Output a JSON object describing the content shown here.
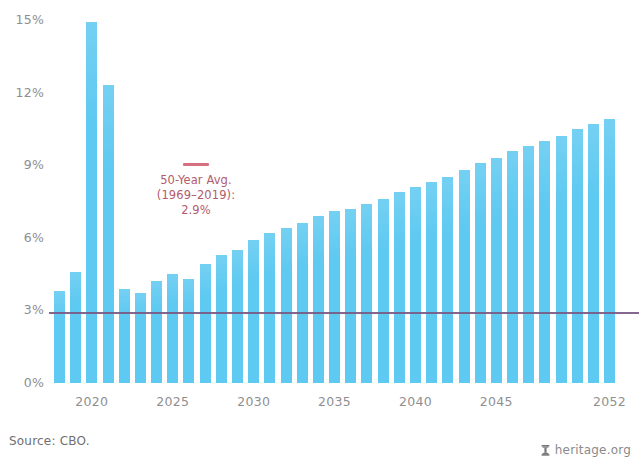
{
  "chart_data": {
    "type": "bar",
    "title": "",
    "subtitle": "",
    "xlabel": "",
    "ylabel": "",
    "categories": [
      "2018",
      "2019",
      "2020",
      "2021",
      "2022",
      "2023",
      "2024",
      "2025",
      "2026",
      "2027",
      "2028",
      "2029",
      "2030",
      "2031",
      "2032",
      "2033",
      "2034",
      "2035",
      "2036",
      "2037",
      "2038",
      "2039",
      "2040",
      "2041",
      "2042",
      "2043",
      "2044",
      "2045",
      "2046",
      "2047",
      "2048",
      "2049",
      "2050",
      "2051",
      "2052"
    ],
    "values": [
      3.8,
      4.6,
      14.9,
      12.3,
      3.9,
      3.7,
      4.2,
      4.5,
      4.3,
      4.9,
      5.3,
      5.5,
      5.9,
      6.2,
      6.4,
      6.6,
      6.9,
      7.1,
      7.2,
      7.4,
      7.6,
      7.9,
      8.1,
      8.3,
      8.5,
      8.8,
      9.1,
      9.3,
      9.6,
      9.8,
      10.0,
      10.2,
      10.5,
      10.7,
      10.9
    ],
    "unit": "%",
    "ylim": [
      0,
      15.6
    ],
    "yticks": [
      0,
      3,
      6,
      9,
      12,
      15
    ],
    "ytick_labels": [
      "0%",
      "3%",
      "6%",
      "9%",
      "12%",
      "15%"
    ],
    "xtick_labels": [
      "2020",
      "2025",
      "2030",
      "2035",
      "2040",
      "2045",
      "2052"
    ],
    "xtick_categories": [
      "2020",
      "2025",
      "2030",
      "2035",
      "2040",
      "2045",
      "2052"
    ],
    "grid": false,
    "legend_position": "inside-left",
    "bar_color": "#5ec9f1",
    "reference_line": {
      "label_lines": [
        "50-Year Avg.",
        "(1969–2019):",
        "2.9%"
      ],
      "value": 2.9,
      "color": "#7a5a84",
      "swatch_color": "#d4707f",
      "text_color": "#b25b6b"
    },
    "axis_text_color": "#8e8e90"
  },
  "footer": {
    "source": "Source: CBO.",
    "brand": "heritage.org",
    "brand_icon": "heritage-logo-icon"
  }
}
